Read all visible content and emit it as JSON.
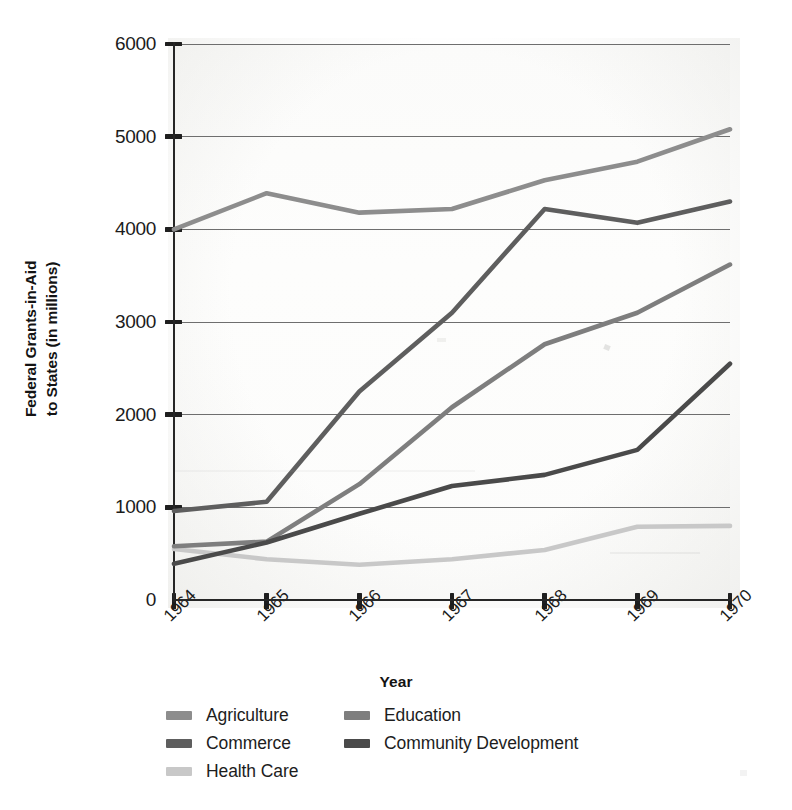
{
  "chart_data": {
    "type": "line",
    "title": "",
    "xlabel": "Year",
    "ylabel": "Federal Grants-in-Aid\nto States (in millions)",
    "x": [
      "1964",
      "1965",
      "1966",
      "1967",
      "1968",
      "1969",
      "1970"
    ],
    "categories": [
      "1964",
      "1965",
      "1966",
      "1967",
      "1968",
      "1969",
      "1970"
    ],
    "ylim": [
      0,
      6000
    ],
    "yticks": [
      "0",
      "1000",
      "2000",
      "3000",
      "4000",
      "5000",
      "6000"
    ],
    "ytick_values": [
      0,
      1000,
      2000,
      3000,
      4000,
      5000,
      6000
    ],
    "grid": "horizontal",
    "legend_position": "bottom",
    "series": [
      {
        "name": "Agriculture",
        "color": "#8d8d8d",
        "values": [
          4000,
          4390,
          4180,
          4220,
          4530,
          4730,
          5080
        ]
      },
      {
        "name": "Commerce",
        "color": "#5e5e5e",
        "values": [
          960,
          1060,
          2250,
          3100,
          4220,
          4070,
          4300
        ]
      },
      {
        "name": "Health Care",
        "color": "#c8c8c8",
        "values": [
          550,
          440,
          380,
          440,
          540,
          790,
          800
        ]
      },
      {
        "name": "Education",
        "color": "#7e7e7e",
        "values": [
          580,
          630,
          1250,
          2080,
          2760,
          3100,
          3620
        ]
      },
      {
        "name": "Community Development",
        "color": "#4a4a4a",
        "values": [
          390,
          620,
          930,
          1230,
          1350,
          1620,
          2550
        ]
      }
    ]
  },
  "axes": {
    "y_title": "Federal Grants-in-Aid\nto States (in millions)",
    "x_title": "Year"
  },
  "legend": {
    "columns": [
      {
        "items": [
          "Agriculture",
          "Commerce",
          "Health Care"
        ]
      },
      {
        "items": [
          "Education",
          "Community Development"
        ]
      }
    ]
  }
}
